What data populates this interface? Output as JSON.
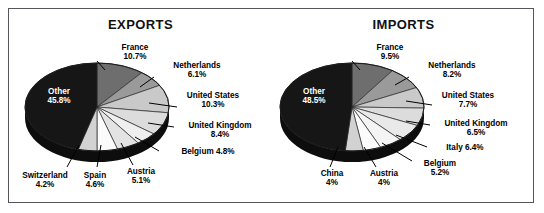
{
  "figure": {
    "border_color": "#55555c",
    "background": "#ffffff"
  },
  "panels": [
    {
      "key": "exports",
      "title": "EXPORTS",
      "other_label": "Other",
      "other_value": "45.8%"
    },
    {
      "key": "imports",
      "title": "IMPORTS",
      "other_label": "Other",
      "other_value": "48.5%"
    }
  ],
  "chart_data": [
    {
      "type": "pie",
      "title": "EXPORTS",
      "xlabel": "",
      "ylabel": "",
      "legend": "none",
      "grid": false,
      "categories": [
        "France",
        "Netherlands",
        "United States",
        "United Kingdom",
        "Belgium",
        "Austria",
        "Spain",
        "Switzerland",
        "Other"
      ],
      "values": [
        10.7,
        6.1,
        10.3,
        8.4,
        4.8,
        5.1,
        4.6,
        4.2,
        45.8
      ],
      "value_labels": [
        "10.7%",
        "6.1%",
        "10.3%",
        "8.4%",
        "4.8%",
        "5.1%",
        "4.6%",
        "4.2%",
        "45.8%"
      ],
      "slice_colors": [
        "#6e6e6e",
        "#9a9a9a",
        "#c9c9c9",
        "#dcdcdc",
        "#efefef",
        "#e3e3e3",
        "#fbfbfb",
        "#d2d2d2",
        "#161616"
      ],
      "annotations": [
        {
          "text": "France",
          "value": "10.7%"
        },
        {
          "text": "Netherlands",
          "value": "6.1%"
        },
        {
          "text": "United States",
          "value": "10.3%"
        },
        {
          "text": "United Kingdom",
          "value": "8.4%"
        },
        {
          "text": "Belgium 4.8%",
          "value": "4.8%"
        },
        {
          "text": "Austria",
          "value": "5.1%"
        },
        {
          "text": "Spain",
          "value": "4.6%"
        },
        {
          "text": "Switzerland",
          "value": "4.2%"
        },
        {
          "text": "Other",
          "value": "45.8%"
        }
      ]
    },
    {
      "type": "pie",
      "title": "IMPORTS",
      "xlabel": "",
      "ylabel": "",
      "legend": "none",
      "grid": false,
      "categories": [
        "France",
        "Netherlands",
        "United States",
        "United Kingdom",
        "Italy",
        "Belgium",
        "Austria",
        "China",
        "Other"
      ],
      "values": [
        9.5,
        8.2,
        7.7,
        6.5,
        6.4,
        5.2,
        4.0,
        4.0,
        48.5
      ],
      "value_labels": [
        "9.5%",
        "8.2%",
        "7.7%",
        "6.5%",
        "6.4%",
        "5.2%",
        "4%",
        "4%",
        "48.5%"
      ],
      "slice_colors": [
        "#6e6e6e",
        "#9a9a9a",
        "#c9c9c9",
        "#dcdcdc",
        "#e9e9e9",
        "#f4f4f4",
        "#fbfbfb",
        "#d2d2d2",
        "#161616"
      ],
      "annotations": [
        {
          "text": "France",
          "value": "9.5%"
        },
        {
          "text": "Netherlands",
          "value": "8.2%"
        },
        {
          "text": "United States",
          "value": "7.7%"
        },
        {
          "text": "United Kingdom",
          "value": "6.5%"
        },
        {
          "text": "Italy  6.4%",
          "value": "6.4%"
        },
        {
          "text": "Belgium",
          "value": "5.2%"
        },
        {
          "text": "Austria",
          "value": "4%"
        },
        {
          "text": "China",
          "value": "4%"
        },
        {
          "text": "Other",
          "value": "48.5%"
        }
      ]
    }
  ],
  "exports_labels": {
    "france_name": "France",
    "france_pct": "10.7%",
    "netherlands_name": "Netherlands",
    "netherlands_pct": "6.1%",
    "us_name": "United States",
    "us_pct": "10.3%",
    "uk_name": "United Kingdom",
    "uk_pct": "8.4%",
    "belgium": "Belgium 4.8%",
    "austria_name": "Austria",
    "austria_pct": "5.1%",
    "spain_name": "Spain",
    "spain_pct": "4.6%",
    "switzerland_name": "Switzerland",
    "switzerland_pct": "4.2%",
    "other_name": "Other",
    "other_pct": "45.8%"
  },
  "imports_labels": {
    "france_name": "France",
    "france_pct": "9.5%",
    "netherlands_name": "Netherlands",
    "netherlands_pct": "8.2%",
    "us_name": "United States",
    "us_pct": "7.7%",
    "uk_name": "United Kingdom",
    "uk_pct": "6.5%",
    "italy": "Italy  6.4%",
    "belgium_name": "Belgium",
    "belgium_pct": "5.2%",
    "austria_name": "Austria",
    "austria_pct": "4%",
    "china_name": "China",
    "china_pct": "4%",
    "other_name": "Other",
    "other_pct": "48.5%"
  }
}
